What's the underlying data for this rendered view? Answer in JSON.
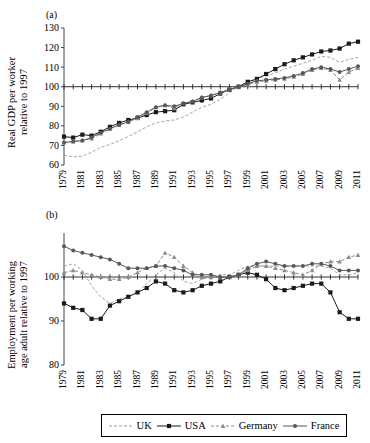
{
  "figure": {
    "panel_a_tag": "(a)",
    "panel_b_tag": "(b)",
    "ylabel_a": "Real GDP per worker\nrelative to 1997",
    "ylabel_b": "Employment per working\nage adult relative to 1997"
  },
  "legend": {
    "position": "bottom-center",
    "entries": [
      {
        "label": "UK",
        "marker": "none",
        "dash": "dashed",
        "color": "#9a9a9a"
      },
      {
        "label": "USA",
        "marker": "square",
        "dash": "solid",
        "color": "#1a1a1a"
      },
      {
        "label": "Germany",
        "marker": "triangle",
        "dash": "dashed",
        "color": "#8c8c8c"
      },
      {
        "label": "France",
        "marker": "circle",
        "dash": "solid",
        "color": "#585858"
      }
    ]
  },
  "chart_data": [
    {
      "type": "line",
      "panel": "(a)",
      "title": "",
      "xlabel": "",
      "ylabel": "Real GDP per worker relative to 1997",
      "x": [
        1979,
        1980,
        1981,
        1982,
        1983,
        1984,
        1985,
        1986,
        1987,
        1988,
        1989,
        1990,
        1991,
        1992,
        1993,
        1994,
        1995,
        1996,
        1997,
        1998,
        1999,
        2000,
        2001,
        2002,
        2003,
        2004,
        2005,
        2006,
        2007,
        2008,
        2009,
        2010,
        2011
      ],
      "xticks": [
        1979,
        1981,
        1983,
        1985,
        1987,
        1989,
        1991,
        1993,
        1995,
        1997,
        1999,
        2001,
        2003,
        2005,
        2007,
        2009,
        2011
      ],
      "xlim": [
        1979,
        2011
      ],
      "ylim": [
        60,
        130
      ],
      "yticks": [
        60,
        70,
        80,
        90,
        100,
        110,
        120,
        130
      ],
      "grid": false,
      "series": [
        {
          "name": "UK",
          "marker": "none",
          "dash": "dashed",
          "color": "#9a9a9a",
          "values": [
            65.0,
            64.2,
            64.5,
            66.5,
            69.0,
            70.5,
            72.5,
            74.5,
            77.0,
            79.5,
            81.5,
            82.5,
            83.0,
            84.5,
            87.0,
            89.5,
            91.0,
            93.5,
            97.0,
            100.0,
            101.5,
            104.0,
            105.5,
            107.0,
            109.0,
            110.5,
            112.0,
            113.5,
            115.5,
            115.0,
            112.5,
            114.0,
            115.0
          ]
        },
        {
          "name": "USA",
          "marker": "square",
          "dash": "solid",
          "color": "#1a1a1a",
          "values": [
            74.5,
            74.0,
            75.5,
            75.0,
            77.0,
            79.5,
            81.5,
            83.0,
            84.0,
            85.5,
            87.0,
            87.5,
            88.0,
            91.0,
            92.0,
            93.0,
            94.0,
            96.5,
            98.5,
            100.0,
            102.5,
            104.0,
            106.5,
            109.0,
            111.5,
            113.5,
            115.0,
            116.5,
            118.0,
            118.5,
            119.5,
            122.0,
            123.0
          ]
        },
        {
          "name": "Germany",
          "marker": "triangle",
          "dash": "dashed",
          "color": "#8c8c8c",
          "values": [
            71.5,
            72.0,
            72.5,
            73.5,
            76.0,
            78.5,
            80.5,
            82.0,
            84.0,
            86.5,
            89.5,
            90.5,
            89.0,
            91.5,
            92.5,
            94.5,
            95.5,
            97.0,
            98.5,
            100.0,
            101.0,
            102.5,
            103.0,
            103.5,
            104.0,
            105.0,
            106.5,
            108.5,
            109.5,
            108.5,
            103.5,
            107.5,
            109.5
          ]
        },
        {
          "name": "France",
          "marker": "circle",
          "dash": "solid",
          "color": "#585858",
          "values": [
            71.5,
            72.0,
            72.5,
            74.0,
            76.5,
            78.5,
            80.5,
            82.0,
            84.5,
            87.0,
            89.5,
            90.5,
            90.0,
            91.5,
            92.5,
            94.5,
            95.5,
            97.0,
            98.5,
            100.0,
            101.5,
            103.0,
            103.5,
            104.0,
            104.5,
            105.5,
            107.0,
            109.0,
            110.0,
            109.0,
            107.5,
            109.0,
            110.5
          ]
        }
      ]
    },
    {
      "type": "line",
      "panel": "(b)",
      "title": "",
      "xlabel": "",
      "ylabel": "Employment per working age adult relative to 1997",
      "x": [
        1979,
        1980,
        1981,
        1982,
        1983,
        1984,
        1985,
        1986,
        1987,
        1988,
        1989,
        1990,
        1991,
        1992,
        1993,
        1994,
        1995,
        1996,
        1997,
        1998,
        1999,
        2000,
        2001,
        2002,
        2003,
        2004,
        2005,
        2006,
        2007,
        2008,
        2009,
        2010,
        2011
      ],
      "xticks": [
        1979,
        1981,
        1983,
        1985,
        1987,
        1989,
        1991,
        1993,
        1995,
        1997,
        1999,
        2001,
        2003,
        2005,
        2007,
        2009,
        2011
      ],
      "xlim": [
        1979,
        2011
      ],
      "ylim": [
        80,
        110
      ],
      "yticks": [
        80,
        90,
        100
      ],
      "grid": false,
      "series": [
        {
          "name": "UK",
          "marker": "none",
          "dash": "dashed",
          "color": "#9a9a9a",
          "values": [
            102.5,
            103.0,
            101.5,
            98.0,
            95.5,
            94.0,
            95.0,
            95.5,
            96.5,
            98.5,
            100.5,
            102.0,
            101.0,
            99.0,
            98.5,
            99.5,
            100.0,
            100.5,
            100.5,
            101.5,
            102.5,
            102.5,
            102.5,
            102.5,
            102.5,
            102.5,
            102.5,
            102.5,
            102.5,
            102.0,
            100.5,
            100.5,
            101.0
          ]
        },
        {
          "name": "USA",
          "marker": "square",
          "dash": "solid",
          "color": "#1a1a1a",
          "values": [
            94.0,
            93.0,
            92.5,
            90.5,
            90.5,
            93.5,
            94.5,
            95.5,
            96.5,
            97.5,
            99.0,
            98.5,
            97.0,
            96.5,
            97.0,
            98.0,
            98.5,
            99.0,
            100.0,
            100.5,
            101.0,
            100.5,
            99.5,
            97.5,
            97.0,
            97.5,
            98.0,
            98.5,
            98.5,
            96.5,
            92.0,
            90.5,
            90.5
          ]
        },
        {
          "name": "Germany",
          "marker": "triangle",
          "dash": "dashed",
          "color": "#8c8c8c",
          "values": [
            101.0,
            101.5,
            101.0,
            100.5,
            100.0,
            99.5,
            99.5,
            100.0,
            101.0,
            102.0,
            102.5,
            105.5,
            104.5,
            102.5,
            101.0,
            100.0,
            100.0,
            100.0,
            100.0,
            100.5,
            101.5,
            102.5,
            102.5,
            102.0,
            101.5,
            101.0,
            100.5,
            101.5,
            103.0,
            103.5,
            103.5,
            104.5,
            105.0
          ]
        },
        {
          "name": "France",
          "marker": "circle",
          "dash": "solid",
          "color": "#585858",
          "values": [
            107.0,
            106.0,
            105.5,
            105.0,
            104.5,
            104.0,
            103.0,
            102.0,
            102.0,
            102.0,
            102.5,
            102.5,
            102.0,
            101.5,
            100.5,
            100.5,
            100.5,
            100.0,
            100.0,
            100.5,
            102.0,
            103.0,
            103.5,
            103.0,
            102.5,
            102.5,
            102.5,
            103.0,
            103.0,
            102.5,
            101.5,
            101.5,
            101.5
          ]
        }
      ]
    }
  ]
}
